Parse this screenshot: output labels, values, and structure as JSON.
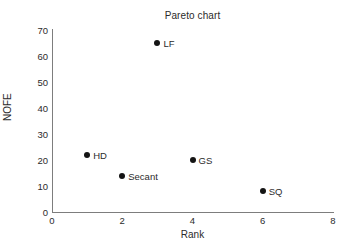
{
  "chart_data": {
    "type": "scatter",
    "title": "Pareto chart",
    "xlabel": "Rank",
    "ylabel": "NOFE",
    "xlim": [
      0,
      8
    ],
    "ylim": [
      0,
      70
    ],
    "xticks": [
      0,
      2,
      4,
      6,
      8
    ],
    "yticks": [
      0,
      10,
      20,
      30,
      40,
      50,
      60,
      70
    ],
    "grid": false,
    "legend": "none",
    "marker": "filled-circle",
    "marker_color": "#141414",
    "axis_color": "#7d7d7d",
    "background": "#ffffff",
    "points": [
      {
        "label": "HD",
        "x": 1,
        "y": 22
      },
      {
        "label": "Secant",
        "x": 2,
        "y": 14
      },
      {
        "label": "LF",
        "x": 3,
        "y": 65
      },
      {
        "label": "GS",
        "x": 4,
        "y": 20
      },
      {
        "label": "SQ",
        "x": 6,
        "y": 8
      }
    ]
  }
}
